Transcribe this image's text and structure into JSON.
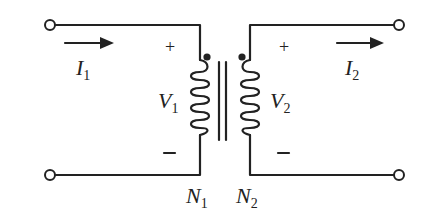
{
  "diagram": {
    "type": "ideal-transformer-circuit",
    "colors": {
      "line": "#222222",
      "background": "#ffffff"
    },
    "primary": {
      "current": {
        "symbol": "I",
        "subscript": "1",
        "direction": "right"
      },
      "voltage": {
        "symbol": "V",
        "subscript": "1"
      },
      "turns": {
        "symbol": "N",
        "subscript": "1"
      },
      "polarity_top": "+",
      "polarity_bottom": "–",
      "dot": "top"
    },
    "secondary": {
      "current": {
        "symbol": "I",
        "subscript": "2",
        "direction": "right"
      },
      "voltage": {
        "symbol": "V",
        "subscript": "2"
      },
      "turns": {
        "symbol": "N",
        "subscript": "2"
      },
      "polarity_top": "+",
      "polarity_bottom": "–",
      "dot": "top"
    },
    "core": "iron-core-double-line"
  }
}
